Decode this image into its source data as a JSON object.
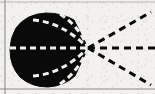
{
  "figure": {
    "kind": "scanned-line-drawing",
    "caption_text": "",
    "background_color": "#f2f1ee",
    "ink_color": "#0a0a0a",
    "rule_color": "#9a9a98",
    "canvas": {
      "width": 155,
      "height": 94
    },
    "borders": {
      "top_rule": {
        "y": 2,
        "x1": 0,
        "x2": 155,
        "color": "#b8b7b4"
      },
      "bottom_rule": {
        "y": 89,
        "x1": 0,
        "x2": 155,
        "color": "#aeada9"
      },
      "left_margin_rule": {
        "x": 5,
        "y1": 0,
        "y2": 94,
        "color": "#8e8d8a"
      }
    },
    "blob": {
      "label": "dark-solid-body",
      "fill": "#0a0a0a",
      "bounds": {
        "left": 10,
        "top": 13,
        "right": 90,
        "bottom": 87
      },
      "apex": {
        "x": 88,
        "y": 48
      },
      "path": "M 88 48 L 74 20 Q 62 13 46 13 Q 26 14 16 28 Q 10 38 10 50 Q 10 66 20 77 Q 31 87 48 87 Q 64 86 75 76 Z"
    },
    "inner_dashed_lines": {
      "label": "white-dashed-radii",
      "color": "#f2f1ee",
      "stroke_width": 3,
      "dash_pattern": "6 4",
      "count": 5,
      "lines": [
        {
          "name": "midline",
          "from": {
            "x": 10,
            "y": 48
          },
          "to": {
            "x": 88,
            "y": 48
          },
          "curve": null
        },
        {
          "name": "upper-inner",
          "from": {
            "x": 33,
            "y": 20
          },
          "to": {
            "x": 88,
            "y": 48
          },
          "curve": {
            "x": 62,
            "y": 22
          }
        },
        {
          "name": "upper-outer",
          "from": {
            "x": 60,
            "y": 14
          },
          "to": {
            "x": 88,
            "y": 48
          },
          "curve": {
            "x": 79,
            "y": 26
          }
        },
        {
          "name": "lower-inner",
          "from": {
            "x": 33,
            "y": 76
          },
          "to": {
            "x": 88,
            "y": 48
          },
          "curve": {
            "x": 62,
            "y": 74
          }
        },
        {
          "name": "lower-outer",
          "from": {
            "x": 60,
            "y": 84
          },
          "to": {
            "x": 88,
            "y": 48
          },
          "curve": {
            "x": 79,
            "y": 71
          }
        }
      ]
    },
    "outer_dashed_rays": {
      "label": "black-dashed-rays",
      "color": "#0a0a0a",
      "stroke_width": 3,
      "dash_pattern": "7 5",
      "count": 3,
      "origin": {
        "x": 88,
        "y": 48
      },
      "rays": [
        {
          "name": "upper-ray",
          "to": {
            "x": 151,
            "y": 12
          }
        },
        {
          "name": "horizontal-ray",
          "to": {
            "x": 155,
            "y": 48
          }
        },
        {
          "name": "lower-ray",
          "to": {
            "x": 151,
            "y": 85
          }
        }
      ]
    }
  }
}
